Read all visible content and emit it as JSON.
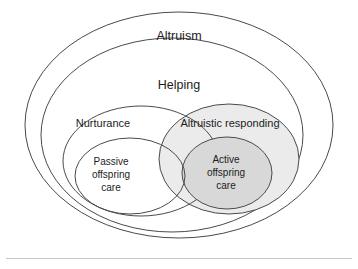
{
  "figure": {
    "type": "nested-venn-diagram",
    "background_color": "#ffffff",
    "outline_color": "#4a4a4a",
    "rule_color": "#c9c9c9"
  },
  "sets": {
    "altruism": {
      "label": "Altruism",
      "fill": "none",
      "cx": 179,
      "cy": 125,
      "rx": 154,
      "ry": 113
    },
    "helping": {
      "label": "Helping",
      "fill": "none",
      "cx": 172,
      "cy": 135,
      "rx": 131,
      "ry": 97
    },
    "nurturance": {
      "label": "Nurturance",
      "fill": "none",
      "cx": 141,
      "cy": 161,
      "rx": 78,
      "ry": 55
    },
    "altruistic_responding": {
      "label": "Altruistic responding",
      "fill": "#ebebeb",
      "cx": 229,
      "cy": 159,
      "rx": 70,
      "ry": 55
    },
    "passive_offspring_care": {
      "label_lines": [
        "Passive",
        "offspring",
        "care"
      ],
      "fill": "none",
      "cx": 130,
      "cy": 176,
      "rx": 55,
      "ry": 38
    },
    "active_offspring_care": {
      "label_lines": [
        "Active",
        "offspring",
        "care"
      ],
      "fill": "#d8d8d8",
      "cx": 227,
      "cy": 173,
      "rx": 45,
      "ry": 36
    }
  },
  "labels": {
    "altruism": "Altruism",
    "helping": "Helping",
    "nurturance": "Nurturance",
    "altruistic_responding": "Altruistic responding",
    "passive_line1": "Passive",
    "passive_line2": "offspring",
    "passive_line3": "care",
    "active_line1": "Active",
    "active_line2": "offspring",
    "active_line3": "care"
  }
}
